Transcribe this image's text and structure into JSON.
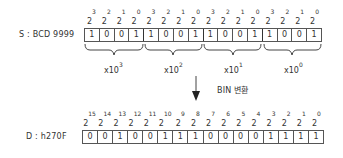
{
  "source": {
    "label": "S : BCD 9999",
    "powers": [
      "3",
      "2",
      "1",
      "0",
      "3",
      "2",
      "1",
      "0",
      "3",
      "2",
      "1",
      "0",
      "3",
      "2",
      "1",
      "0"
    ],
    "bits": [
      "1",
      "0",
      "0",
      "1",
      "1",
      "0",
      "0",
      "1",
      "1",
      "0",
      "0",
      "1",
      "1",
      "0",
      "0",
      "1"
    ],
    "groups": [
      {
        "base": "x10",
        "exp": "3"
      },
      {
        "base": "x10",
        "exp": "2"
      },
      {
        "base": "x10",
        "exp": "1"
      },
      {
        "base": "x10",
        "exp": "0"
      }
    ]
  },
  "conversion": {
    "label": "BIN 변환"
  },
  "dest": {
    "label": "D : h270F",
    "powers": [
      "15",
      "14",
      "13",
      "12",
      "11",
      "10",
      "9",
      "8",
      "7",
      "6",
      "5",
      "4",
      "3",
      "2",
      "1",
      "0"
    ],
    "bits": [
      "0",
      "0",
      "1",
      "0",
      "0",
      "1",
      "1",
      "1",
      "0",
      "0",
      "0",
      "0",
      "1",
      "1",
      "1",
      "1"
    ]
  },
  "power_base": "2"
}
